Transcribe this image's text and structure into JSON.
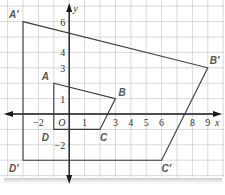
{
  "diagram": {
    "type": "coordinate-plane-dilation",
    "axes": {
      "x_label": "x",
      "y_label": "y",
      "origin_label": "O",
      "x_ticks": [
        {
          "value": -2,
          "label": "−2"
        },
        {
          "value": 1,
          "label": "1"
        },
        {
          "value": 3,
          "label": "3"
        },
        {
          "value": 4,
          "label": "4"
        },
        {
          "value": 5,
          "label": "5"
        },
        {
          "value": 6,
          "label": "6"
        },
        {
          "value": 8,
          "label": "8"
        },
        {
          "value": 9,
          "label": "9"
        }
      ],
      "y_ticks": [
        {
          "value": 6,
          "label": "6"
        },
        {
          "value": 4,
          "label": "4"
        },
        {
          "value": 3,
          "label": "3"
        },
        {
          "value": 1,
          "label": "1"
        },
        {
          "value": -2,
          "label": "−2"
        }
      ],
      "x_range": [
        -4,
        10
      ],
      "y_range": [
        -4,
        7
      ]
    },
    "original": {
      "name": "ABCD",
      "vertices": [
        {
          "label": "A",
          "x": -1,
          "y": 2
        },
        {
          "label": "B",
          "x": 3,
          "y": 1
        },
        {
          "label": "C",
          "x": 2,
          "y": -1
        },
        {
          "label": "D",
          "x": -1,
          "y": -1
        }
      ]
    },
    "image": {
      "name": "A'B'C'D'",
      "vertices": [
        {
          "label": "A′",
          "x": -3,
          "y": 6
        },
        {
          "label": "B′",
          "x": 9,
          "y": 3
        },
        {
          "label": "C′",
          "x": 6,
          "y": -3
        },
        {
          "label": "D′",
          "x": -3,
          "y": -3
        }
      ]
    },
    "colors": {
      "grid": "#cfcfcf",
      "axis": "#1a1a1a",
      "polygon": "#3a3a3a",
      "vertex_label": "#555555"
    }
  }
}
